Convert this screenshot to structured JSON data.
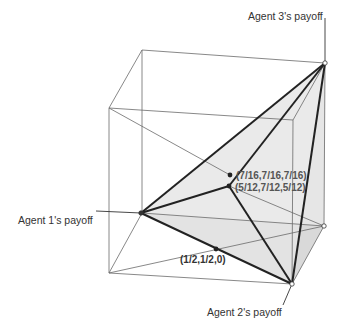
{
  "diagram": {
    "axis_labels": {
      "agent3": "Agent 3's payoff",
      "agent1": "Agent 1's payoff",
      "agent2": "Agent 2's payoff"
    },
    "points": [
      {
        "id": "p_7_16",
        "label": "(7/16,7/16,7/16)"
      },
      {
        "id": "p_5_12",
        "label": "(5/12,7/12,5/12)"
      },
      {
        "id": "p_half",
        "label": "(1/2,1/2,0)"
      }
    ],
    "colors": {
      "line": "#333333",
      "thin_line": "#777777",
      "face_light": "#ececec",
      "face_mid": "#dcdcdc",
      "point": "#222222",
      "label_text": "#555555"
    }
  }
}
